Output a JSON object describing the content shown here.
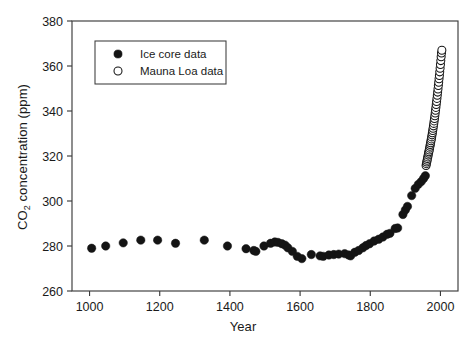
{
  "chart_data": {
    "type": "scatter",
    "title": "",
    "xlabel": "Year",
    "ylabel": "CO2 concentration (ppm)",
    "ylabel_parts": {
      "pre": "CO",
      "sub": "2",
      "post": " concentration (ppm)"
    },
    "xlim": [
      950,
      2050
    ],
    "ylim": [
      260,
      380
    ],
    "xticks": [
      1000,
      1200,
      1400,
      1600,
      1800,
      2000
    ],
    "yticks": [
      260,
      280,
      300,
      320,
      340,
      360,
      380
    ],
    "xtick_labels": [
      "1000",
      "1200",
      "1400",
      "1600",
      "1800",
      "2000"
    ],
    "ytick_labels": [
      "260",
      "280",
      "300",
      "320",
      "340",
      "360",
      "380"
    ],
    "grid": false,
    "legend_position": "upper-left-inset",
    "legend": [
      {
        "label": "Ice core data",
        "marker": "filled-circle",
        "color": "#141414"
      },
      {
        "label": "Mauna Loa data",
        "marker": "open-circle",
        "color": "#141414"
      }
    ],
    "series": [
      {
        "name": "Ice core data",
        "marker": "filled-circle",
        "color": "#141414",
        "points": [
          [
            1006,
            279.0
          ],
          [
            1046,
            280.0
          ],
          [
            1096,
            281.4
          ],
          [
            1146,
            282.6
          ],
          [
            1194,
            282.6
          ],
          [
            1245,
            281.2
          ],
          [
            1327,
            282.6
          ],
          [
            1393,
            280.0
          ],
          [
            1446,
            278.8
          ],
          [
            1468,
            278.0
          ],
          [
            1474,
            277.6
          ],
          [
            1497,
            280.0
          ],
          [
            1516,
            281.2
          ],
          [
            1528,
            281.8
          ],
          [
            1537,
            281.6
          ],
          [
            1548,
            281.0
          ],
          [
            1557,
            280.4
          ],
          [
            1565,
            279.2
          ],
          [
            1578,
            277.6
          ],
          [
            1592,
            275.4
          ],
          [
            1605,
            274.4
          ],
          [
            1632,
            276.2
          ],
          [
            1657,
            275.6
          ],
          [
            1666,
            275.4
          ],
          [
            1682,
            276.0
          ],
          [
            1696,
            276.2
          ],
          [
            1710,
            276.4
          ],
          [
            1727,
            276.6
          ],
          [
            1738,
            276.0
          ],
          [
            1744,
            275.6
          ],
          [
            1756,
            277.2
          ],
          [
            1767,
            278.0
          ],
          [
            1779,
            279.2
          ],
          [
            1788,
            280.2
          ],
          [
            1798,
            281.0
          ],
          [
            1811,
            282.2
          ],
          [
            1824,
            283.0
          ],
          [
            1836,
            284.0
          ],
          [
            1848,
            285.2
          ],
          [
            1856,
            285.6
          ],
          [
            1871,
            287.8
          ],
          [
            1878,
            288.0
          ],
          [
            1893,
            294.0
          ],
          [
            1900,
            296.0
          ],
          [
            1906,
            297.6
          ],
          [
            1918,
            302.4
          ],
          [
            1928,
            305.6
          ],
          [
            1937,
            307.4
          ],
          [
            1945,
            308.6
          ],
          [
            1952,
            310.0
          ],
          [
            1957,
            311.2
          ]
        ]
      },
      {
        "name": "Mauna Loa data",
        "marker": "open-circle",
        "color": "#141414",
        "points": [
          [
            1959,
            315.8
          ],
          [
            1960,
            316.6
          ],
          [
            1961,
            317.3
          ],
          [
            1962,
            318.1
          ],
          [
            1963,
            318.9
          ],
          [
            1964,
            319.6
          ],
          [
            1965,
            320.4
          ],
          [
            1966,
            321.2
          ],
          [
            1967,
            321.9
          ],
          [
            1968,
            322.7
          ],
          [
            1969,
            323.5
          ],
          [
            1970,
            324.3
          ],
          [
            1971,
            325.1
          ],
          [
            1972,
            325.9
          ],
          [
            1973,
            326.8
          ],
          [
            1974,
            327.6
          ],
          [
            1975,
            328.5
          ],
          [
            1976,
            329.4
          ],
          [
            1977,
            330.3
          ],
          [
            1978,
            331.3
          ],
          [
            1979,
            332.3
          ],
          [
            1980,
            333.4
          ],
          [
            1981,
            334.5
          ],
          [
            1982,
            335.6
          ],
          [
            1983,
            336.7
          ],
          [
            1984,
            337.9
          ],
          [
            1985,
            339.1
          ],
          [
            1986,
            340.3
          ],
          [
            1987,
            341.6
          ],
          [
            1988,
            342.9
          ],
          [
            1989,
            344.2
          ],
          [
            1990,
            345.6
          ],
          [
            1991,
            347.0
          ],
          [
            1992,
            348.4
          ],
          [
            1993,
            349.8
          ],
          [
            1994,
            351.3
          ],
          [
            1995,
            352.8
          ],
          [
            1996,
            354.3
          ],
          [
            1997,
            355.8
          ],
          [
            1998,
            357.4
          ],
          [
            1999,
            359.0
          ],
          [
            2000,
            360.7
          ],
          [
            2001,
            362.4
          ],
          [
            2002,
            364.1
          ],
          [
            2003,
            365.8
          ],
          [
            2004,
            367.0
          ]
        ]
      }
    ]
  }
}
